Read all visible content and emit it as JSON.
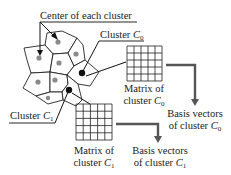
{
  "labels": {
    "center_of_each_cluster": "Center of each cluster",
    "cluster_c0": {
      "text": "Cluster ",
      "var": "C",
      "sub": "0"
    },
    "cluster_c1": {
      "text": "Cluster ",
      "var": "C",
      "sub": "1"
    },
    "matrix_c0": {
      "line1": "Matrix of",
      "line2": "cluster ",
      "var": "C",
      "sub": "0"
    },
    "matrix_c1": {
      "line1": "Matrix of",
      "line2": "cluster ",
      "var": "C",
      "sub": "1"
    },
    "basis_c0": {
      "line1": "Basis vectors",
      "line2": "of cluster ",
      "var": "C",
      "sub": "0"
    },
    "basis_c1": {
      "line1": "Basis vectors",
      "line2": "of cluster ",
      "var": "C",
      "sub": "1"
    }
  },
  "matrices": [
    {
      "name": "matrix-c0",
      "rows": 5,
      "cols": 5
    },
    {
      "name": "matrix-c1",
      "rows": 5,
      "cols": 5
    }
  ],
  "clusters": {
    "count": 9,
    "highlighted": [
      "C0",
      "C1"
    ]
  },
  "colors": {
    "outline": "#222222",
    "center_dot": "#8a8a8a",
    "highlighted_center": "#111111",
    "flow_arrow": "#555555"
  }
}
